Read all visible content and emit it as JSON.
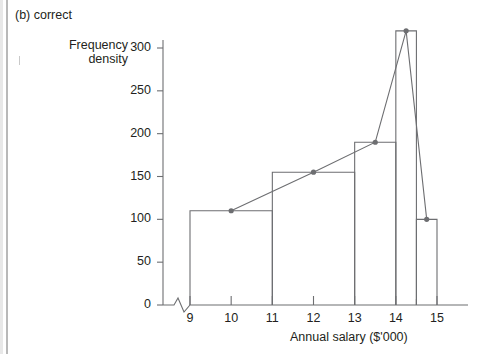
{
  "caption": "(b) correct",
  "axis": {
    "y_title_line1": "Frequency",
    "y_title_line2": "density",
    "x_title": "Annual salary ($'000)"
  },
  "chart_data": {
    "type": "bar",
    "title": "(b) correct",
    "xlabel": "Annual salary ($'000)",
    "ylabel": "Frequency density",
    "xlim": [
      8.6,
      15.4
    ],
    "ylim": [
      0,
      330
    ],
    "grid": false,
    "legend": null,
    "axis_break_x": true,
    "bars": [
      {
        "label": "9-11",
        "x_start": 9,
        "x_end": 11,
        "value": 110,
        "midpoint": 10
      },
      {
        "label": "11-13",
        "x_start": 11,
        "x_end": 13,
        "value": 155,
        "midpoint": 12
      },
      {
        "label": "13-14",
        "x_start": 13,
        "x_end": 14,
        "value": 190,
        "midpoint": 13.5
      },
      {
        "label": "14-14.5",
        "x_start": 14,
        "x_end": 14.5,
        "value": 320,
        "midpoint": 14.25
      },
      {
        "label": "14.5-15",
        "x_start": 14.5,
        "x_end": 15,
        "value": 100,
        "midpoint": 14.75
      }
    ],
    "polygon": {
      "name": "Frequency polygon",
      "points": [
        {
          "x": 10,
          "y": 110
        },
        {
          "x": 12,
          "y": 155
        },
        {
          "x": 13.5,
          "y": 190
        },
        {
          "x": 14.25,
          "y": 320
        },
        {
          "x": 14.75,
          "y": 100
        }
      ]
    },
    "y_ticks": [
      0,
      50,
      100,
      150,
      200,
      250,
      300
    ],
    "x_ticks": [
      9,
      10,
      11,
      12,
      13,
      14,
      15
    ],
    "x_minor_ticks": [
      14.5
    ],
    "x_tick_labels": [
      "9",
      "10",
      "11",
      "12",
      "13",
      "14",
      "15"
    ],
    "y_tick_labels": [
      "0",
      "50",
      "100",
      "150",
      "200",
      "250",
      "300"
    ]
  },
  "colors": {
    "ink": "#231f20",
    "line": "#6d6e71",
    "border": "#b9b9b9"
  }
}
